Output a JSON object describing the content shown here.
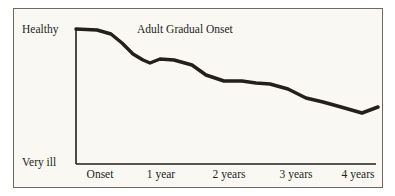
{
  "figure": {
    "background_color": "#ffffff",
    "panel_color": "#faf8f2",
    "border_color": "#6e6a60",
    "ink_color": "#231f1b"
  },
  "title": "Adult Gradual Onset",
  "axis": {
    "y_top_label": "Healthy",
    "y_bottom_label": "Very ill",
    "x_labels": [
      "Onset",
      "1 year",
      "2 years",
      "3 years",
      "4 years"
    ]
  },
  "chart_data": {
    "type": "line",
    "title": "Adult Gradual Onset",
    "xlabel": "",
    "ylabel": "",
    "grid": false,
    "legend": null,
    "line_color": "#231f1b",
    "line_width": 3.5,
    "x_tick_labels": [
      "Onset",
      "1 year",
      "2 years",
      "3 years",
      "4 years"
    ],
    "x_tick_positions": [
      0,
      1,
      2,
      3,
      4
    ],
    "y_tick_labels": [
      "Very ill",
      "Healthy"
    ],
    "ylim": [
      0,
      100
    ],
    "xlim": [
      -0.1,
      4.3
    ],
    "y_axis_description": "Health status from Very ill (bottom) to Healthy (top)",
    "x_axis_description": "Time since onset in years",
    "series": [
      {
        "name": "Adult Gradual Onset",
        "x": [
          -0.05,
          0.25,
          0.45,
          0.6,
          0.75,
          0.9,
          1.0,
          1.15,
          1.35,
          1.6,
          1.8,
          2.05,
          2.3,
          2.5,
          2.7,
          2.95,
          3.2,
          3.45,
          3.7,
          4.0,
          4.25
        ],
        "y": [
          100,
          99,
          96,
          88,
          78,
          72,
          70,
          73,
          72,
          68,
          60,
          55,
          55,
          58,
          60,
          54,
          46,
          43,
          39,
          38,
          43
        ],
        "y_pixel": [
          29,
          30,
          34,
          43,
          54,
          60,
          63,
          59,
          60,
          65,
          75,
          81,
          81,
          83,
          84,
          89,
          98,
          102,
          107,
          113,
          107
        ],
        "x_pixel": [
          76,
          97,
          111,
          122,
          133,
          143,
          150,
          160,
          174,
          192,
          206,
          224,
          242,
          256,
          270,
          288,
          306,
          323,
          341,
          362,
          378
        ]
      }
    ]
  }
}
